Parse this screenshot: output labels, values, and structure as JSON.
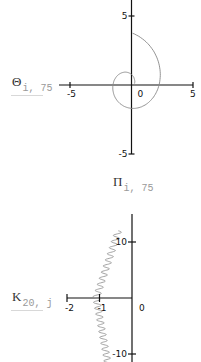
{
  "chart_data": [
    {
      "type": "line",
      "title": "",
      "ylabel": {
        "symbol": "Θ",
        "subscript": "i, 75"
      },
      "xlabel": {
        "symbol": "Π",
        "subscript": "i, 75"
      },
      "xlim": [
        -5,
        5
      ],
      "ylim": [
        -5,
        5
      ],
      "x_ticks": [
        -5,
        0,
        5
      ],
      "y_ticks": [
        5,
        -5
      ],
      "x_tick_labels": [
        "-5",
        "0",
        "5"
      ],
      "y_tick_labels": [
        "5",
        "-5"
      ],
      "grid": false,
      "series": [
        {
          "name": "spiral",
          "color": "#888888",
          "description": "Outward spiral starting near origin, ending upper-left",
          "x": [
            0.0,
            0.2,
            0.3,
            0.2,
            -0.2,
            -0.7,
            -1.1,
            -1.3,
            -1.2,
            -0.8,
            -0.1,
            0.8,
            1.7,
            2.4,
            2.8,
            3.0,
            2.9,
            2.4,
            1.5,
            0.3,
            -1.0,
            -2.3,
            -3.4,
            -4.1
          ],
          "y": [
            0.0,
            0.6,
            1.0,
            1.4,
            1.6,
            1.5,
            1.1,
            0.3,
            -0.6,
            -1.3,
            -1.9,
            -2.1,
            -1.9,
            -1.3,
            -0.4,
            0.8,
            2.0,
            3.2,
            4.2,
            4.8,
            5.0,
            4.8,
            4.1,
            3.2
          ]
        }
      ]
    },
    {
      "type": "line",
      "title": "",
      "ylabel": {
        "symbol": "Κ",
        "subscript": "20, j"
      },
      "xlabel": null,
      "xlim": [
        -2,
        0
      ],
      "ylim": [
        -10,
        10
      ],
      "x_ticks": [
        -2,
        -1,
        0
      ],
      "y_ticks": [
        10,
        -10
      ],
      "x_tick_labels": [
        "-2",
        "-1",
        "0"
      ],
      "y_tick_labels": [
        "10",
        "-10"
      ],
      "grid": false,
      "series": [
        {
          "name": "oscillating curve",
          "color": "#888888",
          "description": "Zigzag curve from about (-0.4, 12) down through (-1.1, 0) to about (-0.8, -11)",
          "top_end": [
            -0.42,
            12.0
          ],
          "mid": [
            -1.1,
            0.0
          ],
          "bottom_end": [
            -0.75,
            -11.5
          ],
          "oscillations": 22
        }
      ]
    }
  ]
}
